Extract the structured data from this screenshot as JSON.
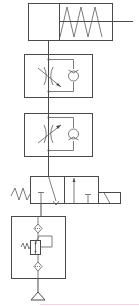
{
  "diagram": {
    "type": "pneumatic-circuit-schematic",
    "components": [
      {
        "id": "cylinder",
        "name": "Single-acting spring-return cylinder",
        "icon": "cylinder-spring-return"
      },
      {
        "id": "flow-control-1",
        "name": "One-way flow control valve (throttle + check)",
        "icon": "flow-control-valve"
      },
      {
        "id": "flow-control-2",
        "name": "One-way flow control valve (throttle + check)",
        "icon": "flow-control-valve"
      },
      {
        "id": "directional-valve",
        "name": "3/2 solenoid valve, spring return",
        "icon": "directional-valve-3-2"
      },
      {
        "id": "frl-unit",
        "name": "Air service unit (filter + pressure regulator)",
        "icon": "frl-unit"
      },
      {
        "id": "air-source",
        "name": "Compressed air source",
        "icon": "pressure-source-triangle"
      }
    ],
    "colors": {
      "line": "#4a4a4a",
      "background": "#ffffff",
      "accent_line": "#f3d6dc"
    }
  }
}
